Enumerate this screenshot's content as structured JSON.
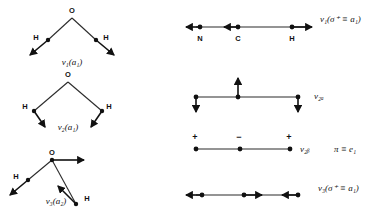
{
  "figure": {
    "background": "#ffffff",
    "ink": "#111111",
    "bond_color": "#2b2b2b"
  },
  "left_column": {
    "molecule": "H2O",
    "modes": [
      {
        "id": "h2o-v1",
        "label": "ν₁(a₁)",
        "description": "symmetric stretch",
        "atoms": [
          {
            "name": "O",
            "label": "O",
            "x": 72,
            "y": 18,
            "label_dx": 0,
            "label_dy": -5
          },
          {
            "name": "H-left",
            "label": "H",
            "x": 48,
            "y": 40,
            "label_dx": -12,
            "label_dy": 0
          },
          {
            "name": "H-right",
            "label": "H",
            "x": 96,
            "y": 40,
            "label_dx": 10,
            "label_dy": 0
          }
        ],
        "vectors": [
          {
            "name": "h-left-stretch",
            "x1": 48,
            "y1": 40,
            "x2": 30,
            "y2": 55
          },
          {
            "name": "h-right-stretch",
            "x1": 96,
            "y1": 40,
            "x2": 114,
            "y2": 55
          }
        ],
        "label_x": 72,
        "label_y": 65
      },
      {
        "id": "h2o-v2",
        "label": "ν₂(a₁)",
        "description": "bend",
        "atoms": [
          {
            "name": "O",
            "label": "O",
            "x": 68,
            "y": 82,
            "label_dx": 0,
            "label_dy": -5
          },
          {
            "name": "H-left",
            "label": "H",
            "x": 34,
            "y": 111,
            "label_dx": -9,
            "label_dy": -2
          },
          {
            "name": "H-right",
            "label": "H",
            "x": 102,
            "y": 111,
            "label_dx": 7,
            "label_dy": -2
          }
        ],
        "vectors": [
          {
            "name": "h-left-bend",
            "x1": 34,
            "y1": 111,
            "x2": 45,
            "y2": 127
          },
          {
            "name": "h-right-bend",
            "x1": 102,
            "y1": 111,
            "x2": 91,
            "y2": 127
          }
        ],
        "label_x": 68,
        "label_y": 130
      },
      {
        "id": "h2o-v3",
        "label": "ν₃(a₂)",
        "description": "antisymmetric stretch",
        "atoms": [
          {
            "name": "O",
            "label": "O",
            "x": 52,
            "y": 160,
            "label_dx": 0,
            "label_dy": -5
          },
          {
            "name": "H-left",
            "label": "H",
            "x": 28,
            "y": 180,
            "label_dx": -12,
            "label_dy": -1
          },
          {
            "name": "H-right",
            "label": "H",
            "x": 76,
            "y": 204,
            "label_dx": 11,
            "label_dy": -3
          }
        ],
        "vectors": [
          {
            "name": "o-translate",
            "x1": 52,
            "y1": 160,
            "x2": 84,
            "y2": 160
          },
          {
            "name": "h-left-shift",
            "x1": 28,
            "y1": 180,
            "x2": 10,
            "y2": 195
          },
          {
            "name": "h-right-shift",
            "x1": 76,
            "y1": 204,
            "x2": 58,
            "y2": 186
          }
        ],
        "label_x": 56,
        "label_y": 204
      }
    ]
  },
  "right_column": {
    "molecule": "HCN",
    "modes": [
      {
        "id": "hcn-v1",
        "label": "ν₁(σ⁺ ≡ a₁)",
        "description": "CH stretch",
        "line": {
          "x1": 196,
          "y1": 27,
          "x2": 308,
          "y2": 27
        },
        "atoms": [
          {
            "name": "N",
            "label": "N",
            "x": 200,
            "y": 27,
            "label_dx": 0,
            "label_dy": 14
          },
          {
            "name": "C",
            "label": "C",
            "x": 238,
            "y": 27,
            "label_dx": 0,
            "label_dy": 14
          },
          {
            "name": "H",
            "label": "H",
            "x": 292,
            "y": 27,
            "label_dx": 0,
            "label_dy": 14
          }
        ],
        "vectors": [
          {
            "name": "n-vector",
            "x1": 200,
            "y1": 27,
            "x2": 186,
            "y2": 27
          },
          {
            "name": "c-vector",
            "x1": 238,
            "y1": 27,
            "x2": 224,
            "y2": 27
          },
          {
            "name": "h-vector",
            "x1": 292,
            "y1": 27,
            "x2": 312,
            "y2": 27
          }
        ],
        "label_x": 320,
        "label_y": 22
      },
      {
        "id": "hcn-v2a",
        "label": "ν₂ₐ",
        "description": "bend in plane",
        "line": {
          "x1": 196,
          "y1": 97,
          "x2": 298,
          "y2": 97
        },
        "atoms": [
          {
            "name": "left-atom",
            "x": 196,
            "y": 97
          },
          {
            "name": "center-atom",
            "x": 238,
            "y": 97
          },
          {
            "name": "right-atom",
            "x": 298,
            "y": 97
          }
        ],
        "vectors": [
          {
            "name": "left-down",
            "x1": 196,
            "y1": 97,
            "x2": 196,
            "y2": 112
          },
          {
            "name": "center-up",
            "x1": 238,
            "y1": 97,
            "x2": 238,
            "y2": 78
          },
          {
            "name": "right-down",
            "x1": 298,
            "y1": 97,
            "x2": 298,
            "y2": 112
          }
        ],
        "label_x": 314,
        "label_y": 99
      },
      {
        "id": "hcn-v2b",
        "label": "ν₂ᵦ",
        "symmetry_label": "π ≡ e₁",
        "description": "bend out of plane",
        "line": {
          "x1": 196,
          "y1": 149,
          "x2": 290,
          "y2": 149
        },
        "atoms": [
          {
            "name": "left-atom",
            "x": 196,
            "y": 149
          },
          {
            "name": "center-atom",
            "x": 240,
            "y": 149
          },
          {
            "name": "right-atom",
            "x": 290,
            "y": 149
          }
        ],
        "signs": [
          {
            "name": "sign-left",
            "text": "+",
            "x": 195,
            "y": 140
          },
          {
            "name": "sign-center",
            "text": "−",
            "x": 239,
            "y": 140
          },
          {
            "name": "sign-right",
            "text": "+",
            "x": 289,
            "y": 140
          }
        ],
        "label_x": 300,
        "label_y": 152,
        "symmetry_label_x": 334,
        "symmetry_label_y": 152
      },
      {
        "id": "hcn-v3",
        "label": "ν₃(σ⁺ ≡ a₁)",
        "description": "CN stretch",
        "line": {
          "x1": 196,
          "y1": 195,
          "x2": 300,
          "y2": 195
        },
        "atoms": [
          {
            "name": "left-atom",
            "x": 202,
            "y": 195
          },
          {
            "name": "center-atom",
            "x": 244,
            "y": 195
          },
          {
            "name": "right-atom",
            "x": 298,
            "y": 195
          }
        ],
        "vectors": [
          {
            "name": "left-vector",
            "x1": 202,
            "y1": 195,
            "x2": 186,
            "y2": 195
          },
          {
            "name": "center-vector",
            "x1": 244,
            "y1": 195,
            "x2": 262,
            "y2": 195
          },
          {
            "name": "right-vector",
            "x1": 298,
            "y1": 195,
            "x2": 282,
            "y2": 195
          }
        ],
        "label_x": 318,
        "label_y": 191
      }
    ]
  }
}
